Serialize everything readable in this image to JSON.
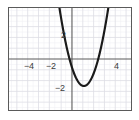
{
  "chart_data": {
    "type": "line",
    "title": "",
    "subtitle": "",
    "xlabel": "",
    "ylabel": "",
    "xlim": [
      -5.75,
      5.5
    ],
    "ylim": [
      -4.8,
      4.6
    ],
    "grid": true,
    "grid_major_step": 1,
    "grid_minor_step": 0.5,
    "legend": "none",
    "axis_color": "#5a5a5a",
    "grid_color": "#d9d9e0",
    "minor_grid_color": "#ececf1",
    "curve_color": "#1a1a1a",
    "x_ticks": [
      -4,
      -2,
      4
    ],
    "x_tick_labels": [
      "−4",
      "−2",
      "4"
    ],
    "y_ticks": [
      2,
      -2
    ],
    "y_tick_labels": [
      "2",
      "−2"
    ],
    "series": [
      {
        "name": "parabola",
        "equation": "y = x^2 - 2x - 1.4",
        "vertex": [
          1.1,
          -2.5
        ],
        "roots": [
          -0.3,
          2.5
        ],
        "x": [
          -0.92,
          -0.7,
          -0.5,
          -0.25,
          0,
          0.25,
          0.5,
          0.75,
          1,
          1.1,
          1.25,
          1.5,
          1.75,
          2,
          2.25,
          2.5,
          2.75,
          3,
          3.12
        ],
        "values": [
          3.3,
          1.9,
          0.85,
          0.06,
          -1.4,
          -1.84,
          -2.15,
          -2.34,
          -2.4,
          -2.41,
          -2.34,
          -2.15,
          -1.84,
          -1.4,
          -0.84,
          -0.15,
          0.66,
          1.6,
          2.05
        ]
      }
    ]
  },
  "labels": {
    "x_neg4": "−4",
    "x_neg2": "−2",
    "x_pos4": "4",
    "y_pos2": "2",
    "y_neg2": "−2"
  }
}
